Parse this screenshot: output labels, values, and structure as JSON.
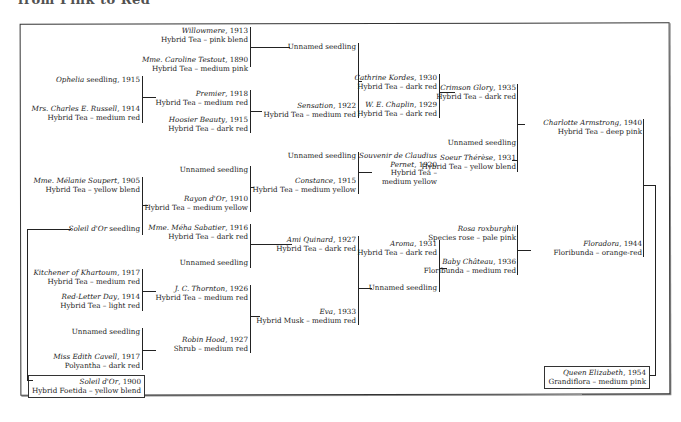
{
  "title_clipped": "from Pink to Red",
  "nodes": {
    "willowmere": {
      "name": "Willowmere",
      "year": ", 1913",
      "desc": "Hybrid Tea – pink blend"
    },
    "caroline": {
      "name": "Mme. Caroline Testout",
      "year": ", 1890",
      "desc": "Hybrid Tea – medium pink"
    },
    "unnamed1": {
      "label": "Unnamed seedling"
    },
    "ophelia": {
      "name": "Ophelia",
      "suffix": " seedling, 1915"
    },
    "russell": {
      "name": "Mrs. Charles E. Russell",
      "year": ", 1914",
      "desc": "Hybrid Tea – medium red"
    },
    "premier": {
      "name": "Premier",
      "year": ", 1918",
      "desc": "Hybrid Tea – medium red"
    },
    "hoosier": {
      "name": "Hoosier Beauty",
      "year": ", 1915",
      "desc": "Hybrid Tea – dark red"
    },
    "sensation": {
      "name": "Sensation",
      "year": ", 1922",
      "desc": "Hybrid Tea – medium red"
    },
    "kordes": {
      "name": "Cathrine Kordes",
      "year": ", 1930",
      "desc": "Hybrid Tea – dark red"
    },
    "chaplin": {
      "name": "W. E. Chaplin",
      "year": ", 1929",
      "desc": "Hybrid Tea – dark red"
    },
    "crimson": {
      "name": "Crimson Glory",
      "year": ", 1935",
      "desc": "Hybrid Tea – dark red"
    },
    "unnamed2": {
      "label": "Unnamed seedling"
    },
    "unnamed3": {
      "label": "Unnamed seedling"
    },
    "pernet": {
      "name1": "Souvenir de Claudius",
      "name2": "Pernet",
      "year": ", 1920",
      "desc1": "Hybrid Tea –",
      "desc2": "medium yellow"
    },
    "therese": {
      "name": "Soeur Thérèse",
      "year": ", 1931",
      "desc": "Hybrid Tea – yellow blend"
    },
    "charlotte": {
      "name": "Charlotte Armstrong",
      "year": ", 1940",
      "desc": "Hybrid Tea – deep pink"
    },
    "soupert": {
      "name": "Mme. Mélanie Soupert",
      "year": ", 1905",
      "desc": "Hybrid Tea – yellow blend"
    },
    "unnamed4": {
      "label": "Unnamed seedling"
    },
    "rayon": {
      "name": "Rayon d'Or",
      "year": ", 1910",
      "desc": "Hybrid Tea – medium yellow"
    },
    "constance": {
      "name": "Constance",
      "year": ", 1915",
      "desc": "Hybrid Tea – medium yellow"
    },
    "soleil_seedling": {
      "name": "Soleil d'Or",
      "suffix": " seedling"
    },
    "sabatier": {
      "name": "Mme. Méha Sabatier",
      "year": ", 1916",
      "desc": "Hybrid Tea – dark red"
    },
    "unnamed5": {
      "label": "Unnamed seedling"
    },
    "quinard": {
      "name": "Ami Quinard",
      "year": ", 1927",
      "desc": "Hybrid Tea – dark red"
    },
    "kitchener": {
      "name": "Kitchener of Khartoum",
      "year": ", 1917",
      "desc": "Hybrid Tea – medium red"
    },
    "redletter": {
      "name": "Red-Letter Day",
      "year": ", 1914",
      "desc": "Hybrid Tea – light red"
    },
    "thornton": {
      "name": "J. C. Thornton",
      "year": ", 1926",
      "desc": "Hybrid Tea – medium red"
    },
    "unnamed6": {
      "label": "Unnamed seedling"
    },
    "cavell": {
      "name": "Miss Edith Cavell",
      "year": ", 1917",
      "desc": "Polyantha – dark red"
    },
    "robinhood": {
      "name": "Robin Hood",
      "year": ", 1927",
      "desc": "Shrub – medium red"
    },
    "eva": {
      "name": "Eva",
      "year": ", 1933",
      "desc": "Hybrid Musk – medium red"
    },
    "aroma": {
      "name": "Aroma",
      "year": ", 1931",
      "desc": "Hybrid Tea – dark red"
    },
    "unnamed7": {
      "label": "Unnamed seedling"
    },
    "roxburghii": {
      "name": "Rosa roxburghii",
      "desc": "Species rose – pale pink"
    },
    "chateau": {
      "name": "Baby Château",
      "year": ", 1936",
      "desc": "Floribunda – medium red"
    },
    "floradora": {
      "name": "Floradora",
      "year": ", 1944",
      "desc": "Floribunda – orange-red"
    },
    "soleil": {
      "name": "Soleil d'Or",
      "year": ", 1900",
      "desc": "Hybrid Foetida – yellow blend"
    },
    "queen": {
      "name": "Queen Elizabeth",
      "year": ", 1954",
      "desc": "Grandiflora – medium pink"
    }
  }
}
